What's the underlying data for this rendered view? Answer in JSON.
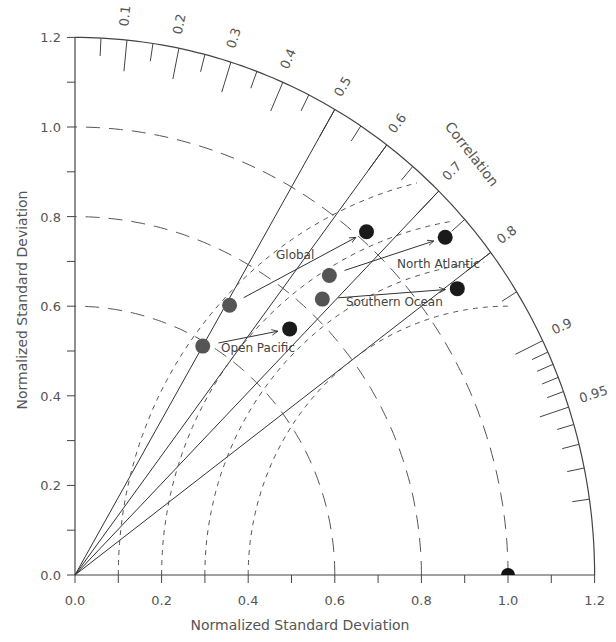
{
  "chart_data": {
    "type": "scatter",
    "subtype": "taylor-diagram",
    "title": "",
    "xlabel": "Normalized Standard Deviation",
    "ylabel": "Normalized Standard Deviation",
    "arc_label": "Correlation",
    "xlim": [
      0.0,
      1.2
    ],
    "ylim": [
      0.0,
      1.2
    ],
    "x_ticks": [
      "0.0",
      "0.2",
      "0.4",
      "0.6",
      "0.8",
      "1.0",
      "1.2"
    ],
    "y_ticks": [
      "0.0",
      "0.2",
      "0.4",
      "0.6",
      "0.8",
      "1.0",
      "1.2"
    ],
    "correlation_ticks": [
      "0.1",
      "0.2",
      "0.3",
      "0.4",
      "0.5",
      "0.6",
      "0.7",
      "0.8",
      "0.9",
      "0.95"
    ],
    "correlation_lines": [
      0.5,
      0.6,
      0.7,
      0.8
    ],
    "std_dev_arcs": [
      0.6,
      0.8,
      1.0
    ],
    "rms_arcs_about_reference": [
      0.6,
      0.7,
      0.8,
      0.9
    ],
    "reference": {
      "label": "Reference",
      "std": 1.0,
      "correlation": 1.0
    },
    "grid": false,
    "legend": "none (inline labels)",
    "series": [
      {
        "name": "Open Pacific",
        "label": "Open Pacific",
        "from": {
          "std": 0.59,
          "correlation": 0.5
        },
        "to": {
          "std": 0.74,
          "correlation": 0.67
        }
      },
      {
        "name": "Global",
        "label": "Global",
        "from": {
          "std": 0.7,
          "correlation": 0.51
        },
        "to": {
          "std": 1.02,
          "correlation": 0.66
        }
      },
      {
        "name": "North Atlantic",
        "label": "North Atlantic",
        "from": {
          "std": 0.89,
          "correlation": 0.66
        },
        "to": {
          "std": 1.14,
          "correlation": 0.75
        }
      },
      {
        "name": "Southern Ocean",
        "label": "Southern Ocean",
        "from": {
          "std": 0.84,
          "correlation": 0.68
        },
        "to": {
          "std": 1.09,
          "correlation": 0.81
        }
      }
    ],
    "colors": {
      "start_point": "#555555",
      "end_point": "#1a1a1a",
      "line": "#333333",
      "text": "#555555"
    }
  },
  "labels": {
    "xlabel": "Normalized Standard Deviation",
    "ylabel": "Normalized Standard Deviation",
    "arc_label": "Correlation",
    "open_pacific": "Open Pacific",
    "global": "Global",
    "north_atlantic": "North Atlantic",
    "southern_ocean": "Southern Ocean"
  }
}
